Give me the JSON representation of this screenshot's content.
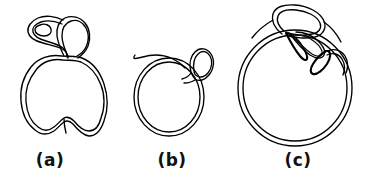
{
  "figure": {
    "type": "line-drawing",
    "background_color": "#ffffff",
    "stroke_color": "#000000",
    "panels": [
      {
        "id": "a",
        "label": "(a)",
        "label_x": 50,
        "label_y": 152,
        "body_shape": "apple-like circle with top notch and bottom notch",
        "loop_shape": "large teardrop loop with small inner eyelet at upper-left",
        "bbox": [
          18,
          10,
          107,
          142
        ]
      },
      {
        "id": "b",
        "label": "(b)",
        "label_x": 172,
        "label_y": 152,
        "body_shape": "plain circle",
        "loop_shape": "single small oval loop at upper right",
        "bbox": [
          132,
          42,
          212,
          140
        ]
      },
      {
        "id": "c",
        "label": "(c)",
        "label_x": 298,
        "label_y": 152,
        "body_shape": "large circle",
        "loop_shape": "large upper loop plus two crossing narrow loops and a small filled loop at right",
        "bbox": [
          234,
          6,
          356,
          148
        ]
      }
    ]
  }
}
